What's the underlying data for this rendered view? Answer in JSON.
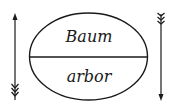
{
  "diagram": {
    "signified": "Baum",
    "signifier": "arbor",
    "colors": {
      "stroke": "#1a1a1a",
      "background": "#ffffff"
    },
    "arrows": [
      {
        "name": "left-arrow",
        "direction": "up"
      },
      {
        "name": "right-arrow",
        "direction": "down"
      }
    ]
  }
}
